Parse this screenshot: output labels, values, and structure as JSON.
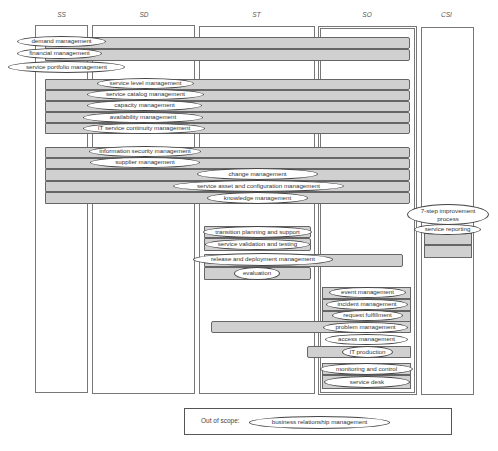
{
  "diagram": {
    "phases": [
      {
        "id": "ss",
        "label": "SS"
      },
      {
        "id": "sd",
        "label": "SD"
      },
      {
        "id": "st",
        "label": "ST"
      },
      {
        "id": "so",
        "label": "SO"
      },
      {
        "id": "csi",
        "label": "CSI"
      }
    ],
    "processes": {
      "demand_management": "demand management",
      "financial_management": "financial management",
      "service_portfolio_management": "service portfolio management",
      "service_level_management": "service level management",
      "service_catalog_management": "service catalog management",
      "capacity_management": "capacity management",
      "availability_management": "availability management",
      "it_service_continuity_management": "IT service continuity management",
      "information_security_management": "information security management",
      "supplier_management": "supplier management",
      "change_management": "change management",
      "service_asset_and_configuration_management": "service asset and configuration management",
      "knowledge_management": "knowledge management",
      "seven_step_improvement_process": "7-step improvement process",
      "service_reporting": "service reporting",
      "transition_planning_and_support": "transition planning and support",
      "service_validation_and_testing": "service validation and testing",
      "release_and_deployment_management": "release and deployment management",
      "evaluation": "evaluation",
      "event_management": "event management",
      "incident_management": "incident management",
      "request_fulfillment": "request fulfillment",
      "problem_management": "problem management",
      "access_management": "access management",
      "it_production": "IT production",
      "monitoring_and_control": "monitoring and control",
      "service_desk": "service desk"
    },
    "out_of_scope": {
      "label": "Out of scope:",
      "items": [
        "business relationship management"
      ]
    }
  }
}
